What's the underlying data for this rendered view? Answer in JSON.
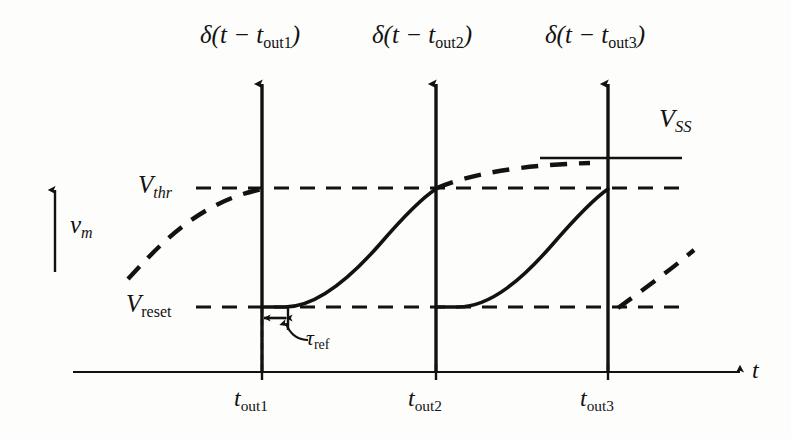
{
  "figure": {
    "type": "diagram",
    "background_color": "#fdfdfb",
    "ink_color": "#121212"
  },
  "axes": {
    "y_axis": {
      "symbol": "v",
      "subscript": "m",
      "style": "italic",
      "arrow": "up",
      "x": 55,
      "y_top": 188,
      "y_bottom": 272
    },
    "x_axis": {
      "symbol": "t",
      "style": "italic",
      "arrow": "right",
      "y": 372,
      "x_start": 73,
      "x_end": 745
    }
  },
  "levels": [
    {
      "name": "v-threshold",
      "symbol": "V",
      "subscript": "thr",
      "subscript_style": "italic",
      "y": 188,
      "line_style": "dashed",
      "x_start": 196,
      "x_end": 682,
      "label_x": 138,
      "label_y": 173
    },
    {
      "name": "v-reset",
      "symbol": "V",
      "subscript": "reset",
      "subscript_style": "roman",
      "y": 307,
      "line_style": "dashed",
      "x_start": 196,
      "x_end": 682,
      "label_x": 128,
      "label_y": 292
    },
    {
      "name": "v-steady-state",
      "symbol": "V",
      "subscript": "SS",
      "subscript_style": "italic",
      "y": 158,
      "line_style": "solid",
      "x_start": 540,
      "x_end": 682,
      "label_x": 660,
      "label_y": 108
    }
  ],
  "spikes": [
    {
      "name": "spike-1",
      "label_symbol": "δ(t − t",
      "label_subscript": "out1",
      "label_suffix": ")",
      "x": 262,
      "y_top": 80,
      "y_bottom": 372,
      "label_x": 200,
      "label_y": 22
    },
    {
      "name": "spike-2",
      "label_symbol": "δ(t − t",
      "label_subscript": "out2",
      "label_suffix": ")",
      "x": 436,
      "y_top": 80,
      "y_bottom": 372,
      "label_x": 372,
      "label_y": 22
    },
    {
      "name": "spike-3",
      "label_symbol": "δ(t − t",
      "label_subscript": "out3",
      "label_suffix": ")",
      "x": 608,
      "y_top": 80,
      "y_bottom": 372,
      "label_x": 545,
      "label_y": 22
    }
  ],
  "tick_labels": [
    {
      "name": "tick-tout1",
      "symbol": "t",
      "subscript": "out1",
      "x": 262,
      "y": 378,
      "label_x": 234,
      "label_y": 386
    },
    {
      "name": "tick-tout2",
      "symbol": "t",
      "subscript": "out2",
      "x": 436,
      "y": 378,
      "label_x": 408,
      "label_y": 386
    },
    {
      "name": "tick-tout3",
      "symbol": "t",
      "subscript": "out3",
      "x": 608,
      "y": 378,
      "label_x": 580,
      "label_y": 386
    }
  ],
  "refractory": {
    "name": "tau-ref",
    "symbol": "τ",
    "subscript": "ref",
    "subscript_style": "roman",
    "arrow_y": 318,
    "x_start": 262,
    "x_end": 288,
    "label_x": 303,
    "label_y": 327
  },
  "traces": [
    {
      "name": "membrane-trace-solid",
      "style": "solid",
      "description": "membrane potential charging from reset to threshold after each spike, flat during refractory period",
      "segments": [
        {
          "type": "flat",
          "x_start": 262,
          "x_end": 285,
          "y": 307
        },
        {
          "type": "charge",
          "x_start": 285,
          "x_end": 436,
          "y_start": 307,
          "y_end": 188
        },
        {
          "type": "flat",
          "x_start": 436,
          "x_end": 458,
          "y": 307
        },
        {
          "type": "charge",
          "x_start": 458,
          "x_end": 608,
          "y_start": 307,
          "y_end": 188
        }
      ]
    },
    {
      "name": "asymptote-trace-dashed",
      "style": "dashed",
      "description": "unclamped exponential relaxation toward V_SS, shown in three dashed arcs",
      "segments": [
        {
          "type": "charge",
          "x_start": 128,
          "x_end": 262,
          "y_start": 272,
          "y_end": 188
        },
        {
          "type": "charge",
          "x_start": 436,
          "x_end": 588,
          "y_start": 188,
          "y_end": 163
        },
        {
          "type": "charge",
          "x_start": 618,
          "x_end": 692,
          "y_start": 307,
          "y_end": 252
        }
      ]
    }
  ]
}
